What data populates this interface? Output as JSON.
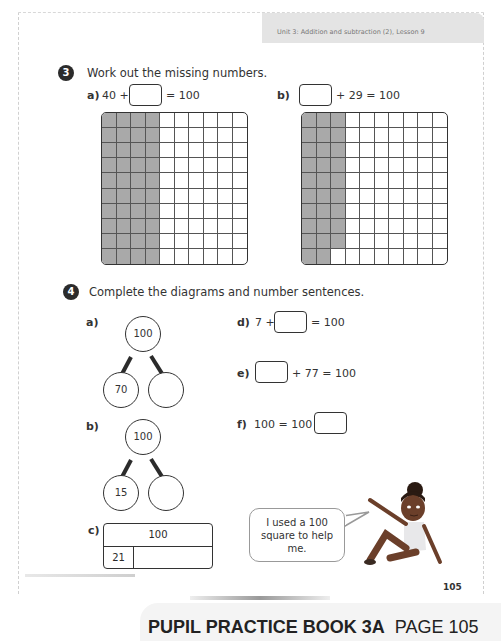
{
  "header": {
    "unit_lesson": "Unit 3: Addition and subtraction (2), Lesson 9"
  },
  "question3": {
    "number": "3",
    "title": "Work out the missing numbers.",
    "a": {
      "label": "a)",
      "before": "40 +",
      "after": "= 100",
      "shaded_count": 40
    },
    "b": {
      "label": "b)",
      "after": "+ 29 = 100",
      "shaded_count": 29
    }
  },
  "question4": {
    "number": "4",
    "title": "Complete the diagrams and number sentences.",
    "a": {
      "label": "a)",
      "whole": "100",
      "part_left": "70",
      "part_right": ""
    },
    "b": {
      "label": "b)",
      "whole": "100",
      "part_left": "15",
      "part_right": ""
    },
    "c": {
      "label": "c)",
      "whole": "100",
      "part_left": "21",
      "part_right": ""
    },
    "d": {
      "label": "d)",
      "before": "7 +",
      "after": "= 100"
    },
    "e": {
      "label": "e)",
      "after": "+ 77 = 100"
    },
    "f": {
      "label": "f)",
      "before": "100 = 100 +"
    }
  },
  "character": {
    "speech": "I used a 100 square to help me."
  },
  "page_number": "105",
  "footer": {
    "book": "PUPIL PRACTICE BOOK 3A",
    "page": "PAGE 105"
  },
  "colors": {
    "shade": "#a9a9a9",
    "ink": "#2b2b2b",
    "skin": "#6b3f2a"
  }
}
